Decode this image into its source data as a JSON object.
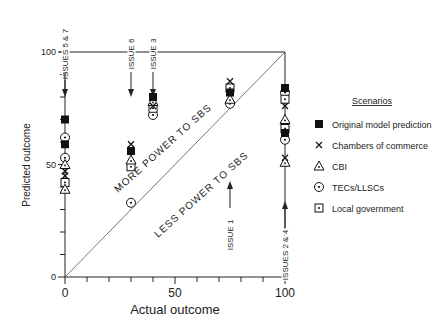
{
  "chart_data": {
    "type": "scatter",
    "title": "",
    "xlabel": "Actual outcome",
    "ylabel": "Predicted outcome",
    "xlim": [
      0,
      100
    ],
    "ylim": [
      0,
      100
    ],
    "x_ticks": [
      0,
      50,
      100
    ],
    "y_ticks": [
      0,
      50,
      100
    ],
    "grid": false,
    "legend": {
      "title": "Scenarios",
      "placement": "right",
      "entries": [
        {
          "name": "Original model prediction",
          "marker": "filled-square"
        },
        {
          "name": "Chambers of commerce",
          "marker": "cross"
        },
        {
          "name": "CBI",
          "marker": "triangle"
        },
        {
          "name": "TECs/LLSCs",
          "marker": "dotted-circle"
        },
        {
          "name": "Local government",
          "marker": "dotted-square"
        }
      ]
    },
    "reference_line": {
      "type": "diagonal",
      "from": [
        0,
        0
      ],
      "to": [
        100,
        100
      ]
    },
    "region_labels": [
      "MORE POWER TO SBS",
      "LESS POWER TO SBS"
    ],
    "issues": [
      {
        "label": "ISSUES 5 & 7",
        "x": 0,
        "direction": "down"
      },
      {
        "label": "ISSUE 6",
        "x": 30,
        "direction": "down"
      },
      {
        "label": "ISSUE 3",
        "x": 40,
        "direction": "down"
      },
      {
        "label": "ISSUE 1",
        "x": 75,
        "direction": "up"
      },
      {
        "label": "ISSUES 2 & 4",
        "x": 100,
        "direction": "up"
      }
    ],
    "series": [
      {
        "name": "Original model prediction",
        "marker": "filled-square",
        "points": [
          [
            0,
            70
          ],
          [
            0,
            59
          ],
          [
            30,
            56
          ],
          [
            40,
            80
          ],
          [
            75,
            82
          ],
          [
            100,
            84
          ],
          [
            100,
            64
          ]
        ]
      },
      {
        "name": "Chambers of commerce",
        "marker": "cross",
        "points": [
          [
            0,
            47
          ],
          [
            0,
            45
          ],
          [
            30,
            59
          ],
          [
            40,
            76
          ],
          [
            75,
            87
          ],
          [
            100,
            76
          ],
          [
            100,
            53
          ]
        ]
      },
      {
        "name": "CBI",
        "marker": "triangle",
        "points": [
          [
            0,
            50
          ],
          [
            0,
            39
          ],
          [
            30,
            52
          ],
          [
            40,
            78
          ],
          [
            75,
            79
          ],
          [
            100,
            70
          ],
          [
            100,
            51
          ]
        ]
      },
      {
        "name": "TECs/LLSCs",
        "marker": "dotted-circle",
        "points": [
          [
            0,
            62
          ],
          [
            0,
            53
          ],
          [
            30,
            33
          ],
          [
            40,
            72
          ],
          [
            75,
            77
          ],
          [
            100,
            82
          ],
          [
            100,
            61
          ]
        ]
      },
      {
        "name": "Local government",
        "marker": "dotted-square",
        "points": [
          [
            0,
            42
          ],
          [
            30,
            49
          ],
          [
            40,
            75
          ],
          [
            75,
            84
          ],
          [
            100,
            79
          ],
          [
            100,
            66
          ]
        ]
      }
    ]
  }
}
